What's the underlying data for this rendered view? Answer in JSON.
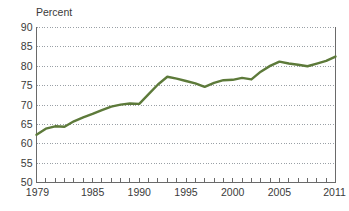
{
  "chart_data": {
    "type": "line",
    "title": "",
    "subtitle": "",
    "unit_label": "Percent",
    "xlabel": "",
    "ylabel": "",
    "ylim": [
      50,
      90
    ],
    "xlim": [
      1979,
      2011
    ],
    "yticks": [
      50,
      55,
      60,
      65,
      70,
      75,
      80,
      85,
      90
    ],
    "ytick_labels": [
      "50",
      "55",
      "60",
      "65",
      "70",
      "75",
      "80",
      "85",
      "90"
    ],
    "xticks": [
      1979,
      1980,
      1981,
      1982,
      1983,
      1984,
      1985,
      1986,
      1987,
      1988,
      1989,
      1990,
      1991,
      1992,
      1993,
      1994,
      1995,
      1996,
      1997,
      1998,
      1999,
      2000,
      2001,
      2002,
      2003,
      2004,
      2005,
      2006,
      2007,
      2008,
      2009,
      2010,
      2011
    ],
    "xtick_labels_shown": [
      "1979",
      "1985",
      "1990",
      "1995",
      "2000",
      "2005",
      "2011"
    ],
    "xtick_label_years": [
      1979,
      1985,
      1990,
      1995,
      2000,
      2005,
      2011
    ],
    "grid": "horizontal-dotted",
    "legend": "none",
    "line_color": "#5d7a3a",
    "axis_color": "#6a6a6a",
    "grid_color": "#9aa0a6",
    "text_color": "#3a3a3a",
    "x": [
      1979,
      1980,
      1981,
      1982,
      1983,
      1984,
      1985,
      1986,
      1987,
      1988,
      1989,
      1990,
      1991,
      1992,
      1993,
      1994,
      1995,
      1996,
      1997,
      1998,
      1999,
      2000,
      2001,
      2002,
      2003,
      2004,
      2005,
      2006,
      2007,
      2008,
      2009,
      2010,
      2011
    ],
    "values": [
      62.3,
      63.9,
      64.5,
      64.4,
      65.8,
      66.8,
      67.7,
      68.7,
      69.6,
      70.1,
      70.4,
      70.3,
      72.8,
      75.3,
      77.3,
      76.8,
      76.2,
      75.6,
      74.7,
      75.7,
      76.4,
      76.5,
      77.0,
      76.6,
      78.6,
      80.1,
      81.2,
      80.7,
      80.4,
      80.0,
      80.7,
      81.4,
      82.5
    ],
    "series": [
      {
        "name": "Percent",
        "values": [
          62.3,
          63.9,
          64.5,
          64.4,
          65.8,
          66.8,
          67.7,
          68.7,
          69.6,
          70.1,
          70.4,
          70.3,
          72.8,
          75.3,
          77.3,
          76.8,
          76.2,
          75.6,
          74.7,
          75.7,
          76.4,
          76.5,
          77.0,
          76.6,
          78.6,
          80.1,
          81.2,
          80.7,
          80.4,
          80.0,
          80.7,
          81.4,
          82.5
        ]
      }
    ]
  }
}
